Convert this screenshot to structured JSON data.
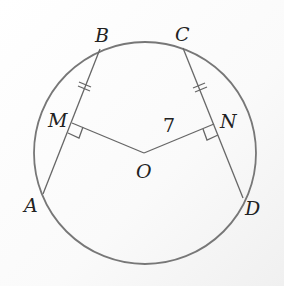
{
  "diagram": {
    "type": "circle-geometry",
    "colors": {
      "circle": "#777777",
      "lines": "#666666",
      "text": "#222222"
    },
    "circle": {
      "center_label": "O",
      "cx": 145,
      "cy": 153,
      "r": 111
    },
    "points": {
      "A": {
        "label": "A",
        "x": 43,
        "y": 194
      },
      "B": {
        "label": "B",
        "x": 100,
        "y": 49
      },
      "C": {
        "label": "C",
        "x": 183,
        "y": 48
      },
      "D": {
        "label": "D",
        "x": 243,
        "y": 198
      },
      "M": {
        "label": "M",
        "x": 72,
        "y": 123
      },
      "N": {
        "label": "N",
        "x": 214,
        "y": 124
      },
      "O": {
        "label": "O",
        "x": 144,
        "y": 153
      }
    },
    "segments": [
      "AB",
      "CD",
      "OM",
      "ON"
    ],
    "right_angles": [
      "OMB",
      "OND"
    ],
    "equal_marks": [
      "MB",
      "NC"
    ],
    "measurement": {
      "segment": "ON",
      "value": "7"
    }
  }
}
